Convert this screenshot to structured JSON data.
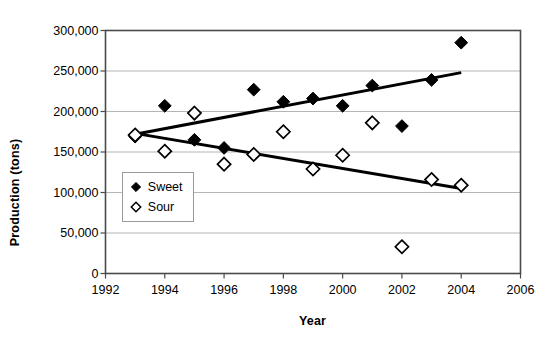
{
  "chart_data": {
    "type": "scatter",
    "title": "",
    "xlabel": "Year",
    "ylabel": "Production (tons)",
    "xlim": [
      1992,
      2006
    ],
    "ylim": [
      0,
      300000
    ],
    "xticks": [
      "1992",
      "1994",
      "1996",
      "1998",
      "2000",
      "2002",
      "2004",
      "2006"
    ],
    "xtick_values": [
      1992,
      1994,
      1996,
      1998,
      2000,
      2002,
      2004,
      2006
    ],
    "yticks": [
      "0",
      "50,000",
      "100,000",
      "150,000",
      "200,000",
      "250,000",
      "300,000"
    ],
    "ytick_values": [
      0,
      50000,
      100000,
      150000,
      200000,
      250000,
      300000
    ],
    "grid": true,
    "grid_axis": "y",
    "legend_position": "lower-left-inside",
    "series": [
      {
        "name": "Sweet",
        "marker": "filled-diamond",
        "color": "#000000",
        "x": [
          1993,
          1994,
          1995,
          1996,
          1997,
          1998,
          1999,
          2000,
          2001,
          2002,
          2003,
          2004
        ],
        "values": [
          169000,
          207000,
          165000,
          155000,
          227000,
          212000,
          216000,
          207000,
          232000,
          182000,
          239000,
          285000
        ],
        "trendline": {
          "x": [
            1993,
            2004
          ],
          "y": [
            172000,
            248000
          ]
        }
      },
      {
        "name": "Sour",
        "marker": "open-diamond",
        "color": "#000000",
        "x": [
          1993,
          1994,
          1995,
          1996,
          1997,
          1998,
          1999,
          2000,
          2001,
          2002,
          2003,
          2004
        ],
        "values": [
          171000,
          151000,
          198000,
          135000,
          147000,
          175000,
          129000,
          146000,
          186000,
          33000,
          116000,
          109000
        ],
        "trendline": {
          "x": [
            1993,
            2004
          ],
          "y": [
            173000,
            105000
          ]
        }
      }
    ]
  },
  "legend": {
    "items": [
      {
        "label": "Sweet",
        "marker": "filled-diamond"
      },
      {
        "label": "Sour",
        "marker": "open-diamond"
      }
    ]
  },
  "axes": {
    "x_title": "Year",
    "y_title": "Production (tons)"
  }
}
